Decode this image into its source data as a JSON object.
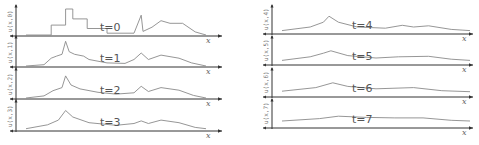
{
  "figure": {
    "x_axis_label": "x",
    "panels": [
      {
        "t_label": "t=0",
        "y_label": "u(x,0)",
        "time": 0
      },
      {
        "t_label": "t=1",
        "y_label": "u(x,1)",
        "time": 1
      },
      {
        "t_label": "t=2",
        "y_label": "u(x,2)",
        "time": 2
      },
      {
        "t_label": "t=3",
        "y_label": "u(x,3)",
        "time": 3
      },
      {
        "t_label": "t=4",
        "y_label": "u(x,4)",
        "time": 4
      },
      {
        "t_label": "t=5",
        "y_label": "u(x,5)",
        "time": 5
      },
      {
        "t_label": "t=6",
        "y_label": "u(x,6)",
        "time": 6
      },
      {
        "t_label": "t=7",
        "y_label": "u(x,7)",
        "time": 7
      }
    ]
  },
  "chart_data": [
    {
      "type": "line",
      "title": "t=0",
      "xlabel": "x",
      "ylabel": "u(x,0)",
      "xlim": [
        0,
        1
      ],
      "ylim": [
        0,
        1
      ],
      "x": [
        0.0,
        0.14,
        0.14,
        0.22,
        0.22,
        0.26,
        0.26,
        0.34,
        0.34,
        0.45,
        0.45,
        0.6,
        0.64,
        0.65,
        0.7,
        0.75,
        0.8,
        0.87,
        0.94,
        1.0
      ],
      "values": [
        0.0,
        0.0,
        0.38,
        0.38,
        1.0,
        1.0,
        0.62,
        0.62,
        0.25,
        0.25,
        0.07,
        0.07,
        0.76,
        0.14,
        0.3,
        0.55,
        0.45,
        0.45,
        0.12,
        0.0
      ]
    },
    {
      "type": "line",
      "title": "t=1",
      "xlabel": "x",
      "ylabel": "u(x,1)",
      "xlim": [
        0,
        1
      ],
      "ylim": [
        0,
        1
      ],
      "x": [
        0.0,
        0.1,
        0.14,
        0.17,
        0.2,
        0.22,
        0.24,
        0.27,
        0.32,
        0.35,
        0.45,
        0.55,
        0.6,
        0.64,
        0.68,
        0.75,
        0.85,
        0.92,
        1.0
      ],
      "values": [
        0.0,
        0.05,
        0.3,
        0.38,
        0.45,
        0.95,
        0.55,
        0.45,
        0.38,
        0.25,
        0.12,
        0.1,
        0.25,
        0.5,
        0.25,
        0.42,
        0.3,
        0.12,
        0.0
      ]
    },
    {
      "type": "line",
      "title": "t=2",
      "xlabel": "x",
      "ylabel": "u(x,2)",
      "xlim": [
        0,
        1
      ],
      "ylim": [
        0,
        1
      ],
      "x": [
        0.0,
        0.1,
        0.15,
        0.2,
        0.22,
        0.25,
        0.3,
        0.4,
        0.5,
        0.6,
        0.64,
        0.68,
        0.75,
        0.85,
        0.93,
        1.0
      ],
      "values": [
        0.0,
        0.08,
        0.28,
        0.4,
        0.85,
        0.5,
        0.35,
        0.22,
        0.15,
        0.2,
        0.45,
        0.25,
        0.4,
        0.3,
        0.1,
        0.0
      ]
    },
    {
      "type": "line",
      "title": "t=3",
      "xlabel": "x",
      "ylabel": "u(x,3)",
      "xlim": [
        0,
        1
      ],
      "ylim": [
        0,
        1
      ],
      "x": [
        0.0,
        0.12,
        0.18,
        0.22,
        0.26,
        0.35,
        0.5,
        0.6,
        0.64,
        0.68,
        0.75,
        0.85,
        0.94,
        1.0
      ],
      "values": [
        0.05,
        0.2,
        0.38,
        0.75,
        0.5,
        0.28,
        0.18,
        0.25,
        0.35,
        0.25,
        0.38,
        0.28,
        0.1,
        0.05
      ]
    },
    {
      "type": "line",
      "title": "t=4",
      "xlabel": "x",
      "ylabel": "u(x,4)",
      "xlim": [
        0,
        1
      ],
      "ylim": [
        0,
        1
      ],
      "x": [
        0.0,
        0.15,
        0.22,
        0.25,
        0.3,
        0.4,
        0.55,
        0.64,
        0.7,
        0.78,
        0.9,
        1.0
      ],
      "values": [
        0.1,
        0.25,
        0.45,
        0.7,
        0.45,
        0.25,
        0.2,
        0.32,
        0.25,
        0.3,
        0.15,
        0.1
      ]
    },
    {
      "type": "line",
      "title": "t=5",
      "xlabel": "x",
      "ylabel": "u(x,5)",
      "xlim": [
        0,
        1
      ],
      "ylim": [
        0,
        1
      ],
      "x": [
        0.0,
        0.15,
        0.22,
        0.26,
        0.35,
        0.5,
        0.62,
        0.78,
        0.9,
        1.0
      ],
      "values": [
        0.15,
        0.3,
        0.45,
        0.55,
        0.35,
        0.25,
        0.3,
        0.32,
        0.2,
        0.15
      ]
    },
    {
      "type": "line",
      "title": "t=6",
      "xlabel": "x",
      "ylabel": "u(x,6)",
      "xlim": [
        0,
        1
      ],
      "ylim": [
        0,
        1
      ],
      "x": [
        0.0,
        0.18,
        0.27,
        0.35,
        0.5,
        0.7,
        0.85,
        1.0
      ],
      "values": [
        0.2,
        0.35,
        0.55,
        0.4,
        0.3,
        0.35,
        0.22,
        0.18
      ]
    },
    {
      "type": "line",
      "title": "t=7",
      "xlabel": "x",
      "ylabel": "u(x,7)",
      "xlim": [
        0,
        1
      ],
      "ylim": [
        0,
        1
      ],
      "x": [
        0.0,
        0.2,
        0.3,
        0.45,
        0.6,
        0.75,
        0.9,
        1.0
      ],
      "values": [
        0.25,
        0.35,
        0.45,
        0.4,
        0.38,
        0.38,
        0.28,
        0.25
      ]
    }
  ]
}
